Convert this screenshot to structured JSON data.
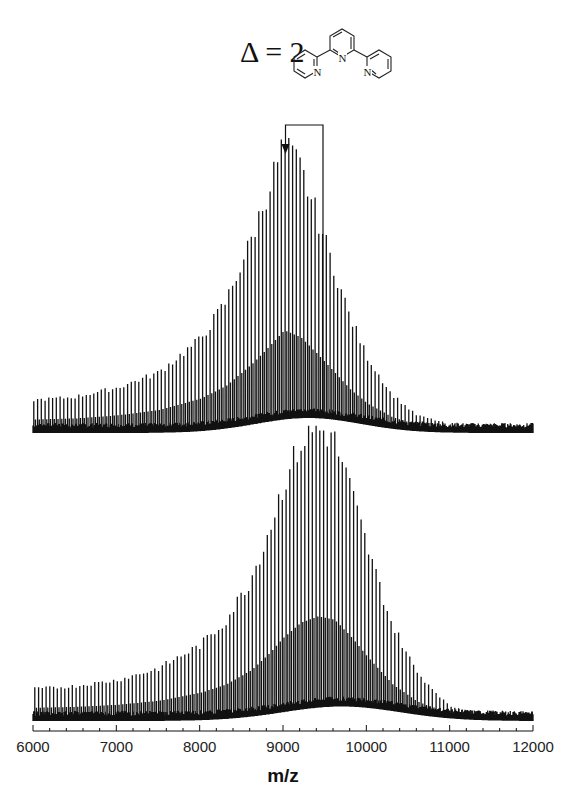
{
  "chart_data": {
    "type": "line",
    "title": "",
    "annotation": {
      "label": "Δ = 2",
      "structure": "2,2':6',2''-terpyridine",
      "structure_atoms": [
        "N",
        "N",
        "N"
      ],
      "arrow_from_mz": 9480,
      "arrow_to_mz": 9030
    },
    "xlabel": "m/z",
    "ylabel": "",
    "xlim": [
      6000,
      12000
    ],
    "xticks": [
      6000,
      7000,
      8000,
      9000,
      10000,
      11000,
      12000
    ],
    "xtick_labels": [
      "6000",
      "7000",
      "8000",
      "9000",
      "10000",
      "11000",
      "12000"
    ],
    "grid": false,
    "legend": null,
    "series": [
      {
        "name": "top spectrum",
        "peak_spacing_mz": 45,
        "envelope": {
          "x": [
            6000,
            6500,
            7000,
            7500,
            8000,
            8300,
            8600,
            8800,
            9000,
            9200,
            9400,
            9600,
            9800,
            10000,
            10300,
            10600,
            11000,
            11500,
            12000
          ],
          "y": [
            0.1,
            0.11,
            0.14,
            0.19,
            0.3,
            0.42,
            0.62,
            0.78,
            0.95,
            0.88,
            0.72,
            0.55,
            0.38,
            0.25,
            0.12,
            0.05,
            0.02,
            0.01,
            0.01
          ]
        },
        "peak_mz": 9030,
        "baseline_hump": {
          "center": 9300,
          "width": 900,
          "height": 0.05
        }
      },
      {
        "name": "bottom spectrum",
        "peak_spacing_mz": 45,
        "envelope": {
          "x": [
            6000,
            6500,
            7000,
            7500,
            8000,
            8300,
            8600,
            8800,
            9000,
            9200,
            9400,
            9600,
            9800,
            10000,
            10300,
            10600,
            11000,
            11500,
            12000
          ],
          "y": [
            0.1,
            0.11,
            0.13,
            0.17,
            0.25,
            0.33,
            0.47,
            0.62,
            0.8,
            0.94,
            1.0,
            0.97,
            0.8,
            0.6,
            0.33,
            0.16,
            0.04,
            0.01,
            0.01
          ]
        },
        "peak_mz": 9480,
        "baseline_hump": {
          "center": 9700,
          "width": 1000,
          "height": 0.05
        }
      }
    ]
  }
}
